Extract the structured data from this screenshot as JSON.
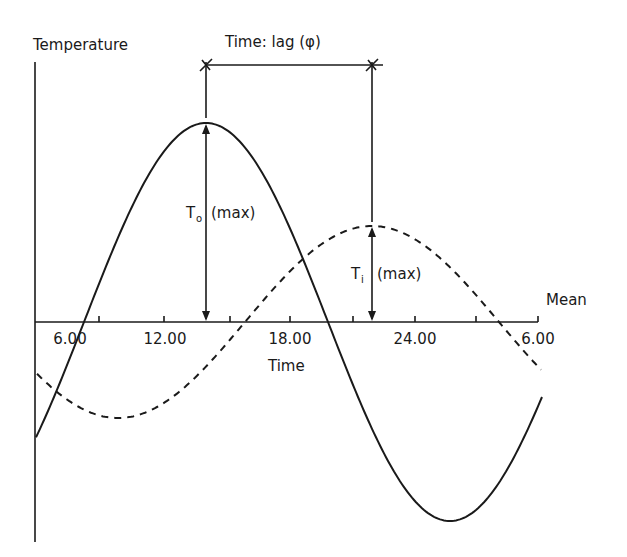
{
  "diagram": {
    "y_axis_label": "Temperature",
    "x_axis_label": "Time",
    "mean_label": "Mean",
    "lag_label": "Time: lag (φ)",
    "outdoor_max_label": {
      "symbol": "T",
      "subscript": "o",
      "suffix": "(max)"
    },
    "indoor_max_label": {
      "symbol": "T",
      "subscript": "i",
      "suffix": "(max)"
    },
    "tick_labels": [
      {
        "text": "6.00",
        "x": 70
      },
      {
        "text": "12.00",
        "x": 165
      },
      {
        "text": "18.00",
        "x": 290
      },
      {
        "text": "24.00",
        "x": 415
      },
      {
        "text": "6.00",
        "x": 538
      }
    ],
    "colors": {
      "ink": "#1a1a1a",
      "background": "#ffffff"
    }
  },
  "chart_data": {
    "type": "line",
    "title": "",
    "xlabel": "Time",
    "ylabel": "Temperature",
    "x_ticks": [
      "6.00",
      "12.00",
      "18.00",
      "24.00",
      "6.00"
    ],
    "reference_line": "Mean",
    "series": [
      {
        "name": "Outdoor temperature T_o",
        "style": "solid",
        "peak_time": "~14.00",
        "relative_amplitude": 1.0
      },
      {
        "name": "Indoor temperature T_i",
        "style": "dashed",
        "peak_time": "~22.00",
        "relative_amplitude": 0.48
      }
    ],
    "annotations": [
      "T_o (max)",
      "T_i (max)",
      "Time: lag (φ)"
    ]
  }
}
